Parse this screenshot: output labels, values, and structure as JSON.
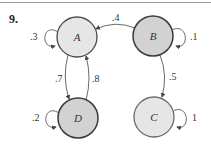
{
  "problem_number": "9.",
  "colors": {
    "node_light": "#e6e6e6",
    "node_dark": "#d2d2d2",
    "stroke": "#4a4a4a",
    "edge": "#444444"
  },
  "nodes": [
    {
      "id": "A",
      "label": "A",
      "cx": 77,
      "cy": 37,
      "r": 20,
      "fill": "light"
    },
    {
      "id": "B",
      "label": "B",
      "cx": 153,
      "cy": 36,
      "r": 20,
      "fill": "dark"
    },
    {
      "id": "D",
      "label": "D",
      "cx": 78,
      "cy": 118,
      "r": 20,
      "fill": "dark"
    },
    {
      "id": "C",
      "label": "C",
      "cx": 154,
      "cy": 117,
      "r": 20,
      "fill": "light"
    }
  ],
  "edges": [
    {
      "from": "B",
      "to": "A",
      "label": ".4"
    },
    {
      "from": "B",
      "to": "C",
      "label": ".5"
    },
    {
      "from": "A",
      "to": "D",
      "label": ".7"
    },
    {
      "from": "D",
      "to": "A",
      "label": ".8"
    },
    {
      "from": "A",
      "to": "A",
      "label": ".3"
    },
    {
      "from": "B",
      "to": "B",
      "label": ".1"
    },
    {
      "from": "D",
      "to": "D",
      "label": ".2"
    },
    {
      "from": "C",
      "to": "C",
      "label": "1"
    }
  ]
}
